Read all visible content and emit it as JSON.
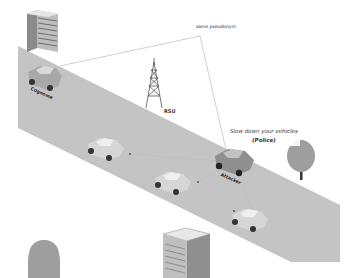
{
  "diagram": {
    "type": "vehicular-network-scene",
    "labels": {
      "pseudonym": "same pseudonym",
      "rsu": "RSU",
      "victim": "Cognome",
      "attacker": "Attacker",
      "message_line1": "Slow down your vehicles",
      "message_line2": "(Police)"
    },
    "colors": {
      "road": "#c4c4c4",
      "background": "#ffffff",
      "attacker_car": "#8f8f8f",
      "car": "#d6d6d6",
      "link_line": "#bdbdbd",
      "tree": "#9e9e9e",
      "building": "#a9a9a9"
    },
    "nodes": [
      {
        "id": "victim-car",
        "label": "Cognome"
      },
      {
        "id": "rsu-tower",
        "label": "RSU"
      },
      {
        "id": "car-1",
        "label": ""
      },
      {
        "id": "car-2",
        "label": ""
      },
      {
        "id": "attacker-car",
        "label": "Attacker"
      },
      {
        "id": "car-3",
        "label": ""
      }
    ]
  }
}
